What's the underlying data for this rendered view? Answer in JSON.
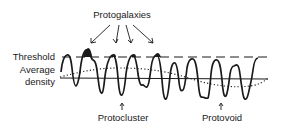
{
  "diagram": {
    "title_label": "Protogalaxies",
    "left_labels": {
      "threshold": "Threshold",
      "average_line1": "Average",
      "average_line2": "density"
    },
    "bottom_labels": {
      "protocluster": "Protocluster",
      "protovoid": "Protovoid"
    },
    "colors": {
      "ink": "#1a1a1a",
      "background": "#ffffff"
    },
    "elements": [
      "density fluctuation waveform",
      "threshold dashed line",
      "average density solid line",
      "long-wavelength dotted curve",
      "filled peaks above threshold (protogalaxies)"
    ]
  }
}
